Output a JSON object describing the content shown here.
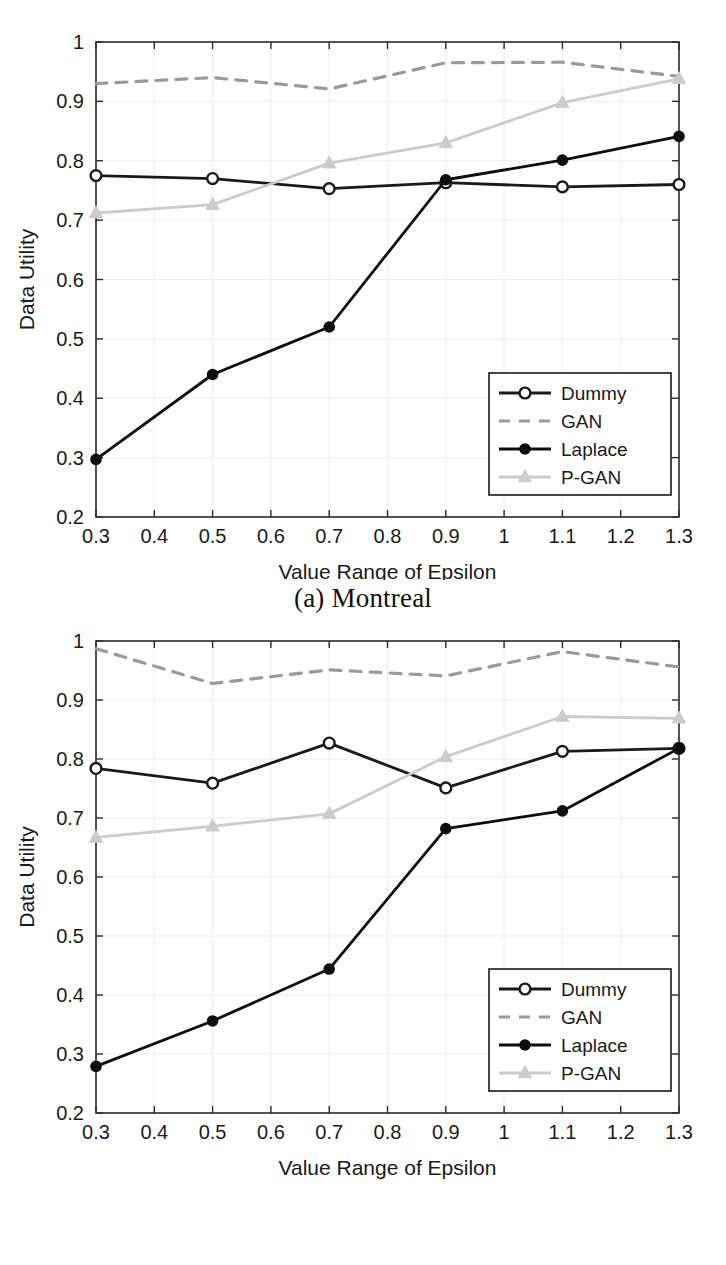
{
  "page": {
    "background": "#ffffff",
    "width": 726,
    "height": 1265
  },
  "figures": [
    {
      "id": "figure-a",
      "caption": "(a) Montreal"
    },
    {
      "id": "figure-b",
      "caption": "(b) Las Vegas"
    }
  ],
  "colors": {
    "axis": "#2b2b2b",
    "grid": "#eeeeee",
    "dummy": "#1a1a1a",
    "gan": "#9a9a9a",
    "laplace": "#0d0d0d",
    "pgan": "#cccccc",
    "text": "#1a1a1a",
    "legend_border": "#1a1a1a",
    "legend_bg": "#ffffff"
  },
  "axis": {
    "xlabel": "Value Range of Epsilon",
    "ylabel": "Data Utility",
    "xlim": [
      0.3,
      1.3
    ],
    "ylim": [
      0.2,
      1.0
    ],
    "xticks": [
      "0.3",
      "0.4",
      "0.5",
      "0.6",
      "0.7",
      "0.8",
      "0.9",
      "1",
      "1.1",
      "1.2",
      "1.3"
    ],
    "xtick_values": [
      0.3,
      0.4,
      0.5,
      0.6,
      0.7,
      0.8,
      0.9,
      1.0,
      1.1,
      1.2,
      1.3
    ],
    "yticks": [
      "0.2",
      "0.3",
      "0.4",
      "0.5",
      "0.6",
      "0.7",
      "0.8",
      "0.9",
      "1"
    ],
    "ytick_values": [
      0.2,
      0.3,
      0.4,
      0.5,
      0.6,
      0.7,
      0.8,
      0.9,
      1.0
    ]
  },
  "legend": {
    "position": "lower-right",
    "entries": [
      {
        "label": "Dummy",
        "marker": "circle-open",
        "style": "solid",
        "color": "#1a1a1a"
      },
      {
        "label": "GAN",
        "marker": "none",
        "style": "dashed",
        "color": "#9a9a9a"
      },
      {
        "label": "Laplace",
        "marker": "circle-filled",
        "style": "solid",
        "color": "#0d0d0d"
      },
      {
        "label": "P-GAN",
        "marker": "triangle",
        "style": "solid",
        "color": "#cccccc"
      }
    ]
  },
  "chart_data": [
    {
      "type": "line",
      "title": "(a) Montreal",
      "xlabel": "Value Range of Epsilon",
      "ylabel": "Data Utility",
      "xlim": [
        0.3,
        1.3
      ],
      "ylim": [
        0.2,
        1.0
      ],
      "grid": true,
      "legend_position": "lower-right",
      "x": [
        0.3,
        0.5,
        0.7,
        0.9,
        1.1,
        1.3
      ],
      "series": [
        {
          "name": "Dummy",
          "values": [
            0.775,
            0.77,
            0.753,
            0.763,
            0.756,
            0.76
          ]
        },
        {
          "name": "GAN",
          "values": [
            0.93,
            0.94,
            0.921,
            0.965,
            0.966,
            0.942
          ]
        },
        {
          "name": "Laplace",
          "values": [
            0.297,
            0.44,
            0.52,
            0.768,
            0.801,
            0.841
          ]
        },
        {
          "name": "P-GAN",
          "values": [
            0.712,
            0.726,
            0.796,
            0.83,
            0.898,
            0.938
          ]
        }
      ]
    },
    {
      "type": "line",
      "title": "(b) Las Vegas",
      "xlabel": "Value Range of Epsilon",
      "ylabel": "Data Utility",
      "xlim": [
        0.3,
        1.3
      ],
      "ylim": [
        0.2,
        1.0
      ],
      "grid": true,
      "legend_position": "lower-right",
      "x": [
        0.3,
        0.5,
        0.7,
        0.9,
        1.1,
        1.3
      ],
      "series": [
        {
          "name": "Dummy",
          "values": [
            0.784,
            0.759,
            0.827,
            0.751,
            0.813,
            0.818
          ]
        },
        {
          "name": "GAN",
          "values": [
            0.987,
            0.928,
            0.951,
            0.941,
            0.982,
            0.956
          ]
        },
        {
          "name": "Laplace",
          "values": [
            0.279,
            0.356,
            0.444,
            0.682,
            0.712,
            0.818
          ]
        },
        {
          "name": "P-GAN",
          "values": [
            0.667,
            0.686,
            0.707,
            0.804,
            0.872,
            0.869
          ]
        }
      ]
    }
  ]
}
